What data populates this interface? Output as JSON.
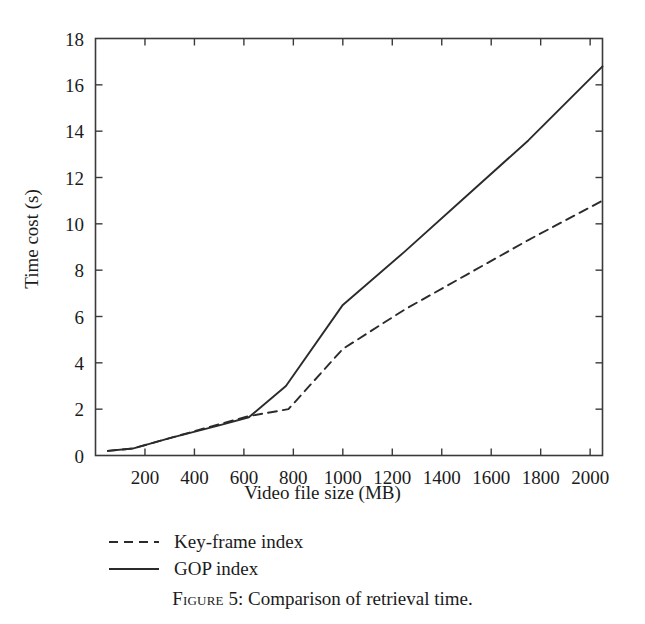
{
  "figure": {
    "caption_prefix": "Figure 5:",
    "caption_figure_word": "Figure",
    "caption_number": "5:",
    "caption_text": "Comparison of retrieval time.",
    "caption_full": "Figure 5: Comparison of retrieval time."
  },
  "legend": {
    "position": "below-axes-left",
    "items": [
      {
        "label": "Key-frame index",
        "style": "dashed",
        "color": "#2b2b2b"
      },
      {
        "label": "GOP index",
        "style": "solid",
        "color": "#2b2b2b"
      }
    ]
  },
  "chart_data": {
    "type": "line",
    "title": "",
    "xlabel": "Video file size (MB)",
    "ylabel": "Time cost (s)",
    "xlim": [
      0,
      2050
    ],
    "ylim": [
      0,
      18
    ],
    "xticks": [
      200,
      400,
      600,
      800,
      1000,
      1200,
      1400,
      1600,
      1800,
      2000
    ],
    "xtick_labels": [
      "200",
      "400",
      "600",
      "800",
      "1000",
      "1200",
      "1400",
      "1600",
      "1800",
      "2000"
    ],
    "yticks": [
      0,
      2,
      4,
      6,
      8,
      10,
      12,
      14,
      16,
      18
    ],
    "ytick_labels": [
      "0",
      "2",
      "4",
      "6",
      "8",
      "10",
      "12",
      "14",
      "16",
      "18"
    ],
    "grid": false,
    "frame": "box",
    "tick_direction": "in",
    "series": [
      {
        "name": "GOP index",
        "style": "solid",
        "color": "#2b2b2b",
        "x": [
          50,
          150,
          300,
          500,
          620,
          770,
          1000,
          1250,
          1500,
          1750,
          2050
        ],
        "y": [
          0.2,
          0.3,
          0.75,
          1.3,
          1.65,
          3.0,
          6.5,
          8.8,
          11.2,
          13.6,
          16.8
        ]
      },
      {
        "name": "Key-frame index",
        "style": "dashed",
        "color": "#2b2b2b",
        "x": [
          50,
          150,
          300,
          500,
          620,
          780,
          1000,
          1250,
          1500,
          1750,
          2050
        ],
        "y": [
          0.2,
          0.3,
          0.75,
          1.35,
          1.7,
          2.0,
          4.6,
          6.3,
          7.8,
          9.3,
          11.0
        ]
      }
    ]
  },
  "colors": {
    "background": "#ffffff",
    "ink": "#1b1b1b",
    "line": "#2b2b2b",
    "axis": "#3a3a3a"
  }
}
